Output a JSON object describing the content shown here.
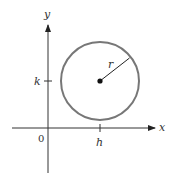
{
  "figure": {
    "axes": {
      "x_label": "x",
      "y_label": "y",
      "origin_label": "0"
    },
    "circle": {
      "center_x_label": "h",
      "center_y_label": "k",
      "radius_label": "r"
    },
    "colors": {
      "axis": "#333333",
      "circle_stroke": "#777777",
      "center_point": "#111111",
      "radius_line": "#222222",
      "text": "#333333"
    }
  }
}
